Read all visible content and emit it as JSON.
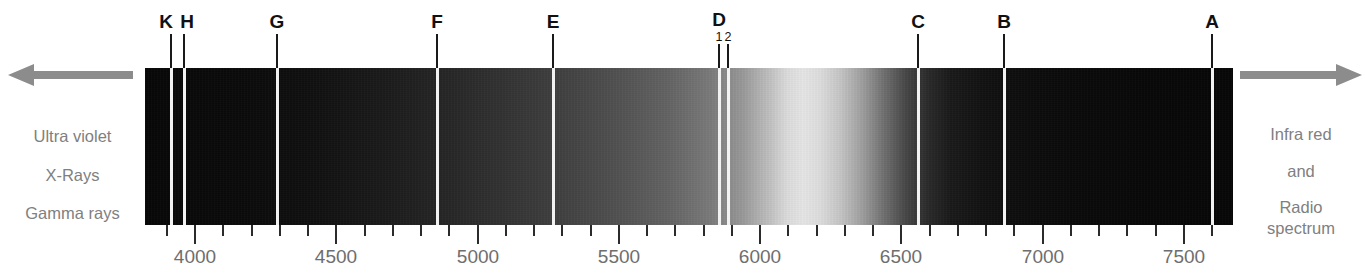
{
  "figure": {
    "band": {
      "x_left_px": 145,
      "x_right_px": 1233,
      "y_top_px": 68,
      "y_bottom_px": 225,
      "wavelength_min": 3830,
      "wavelength_max": 7680,
      "unit": "angstrom"
    },
    "colors": {
      "line": "#f2f2f2",
      "arrow": "#8c8c8c",
      "side_text": "#808080",
      "axis_text": "#6e6e6e",
      "label_text": "#111111",
      "tick": "#2b2b2b",
      "background": "#ffffff"
    }
  },
  "left_annotation": {
    "arrow_icon": "arrow-left-icon",
    "arrow_direction": "left",
    "lines": [
      "Ultra violet",
      "X-Rays",
      "Gamma rays"
    ]
  },
  "right_annotation": {
    "arrow_icon": "arrow-right-icon",
    "arrow_direction": "right",
    "lines": [
      "Infra red",
      "and",
      "Radio",
      "spectrum"
    ]
  },
  "chart_data": {
    "type": "line",
    "xlabel": "",
    "ylabel": "",
    "xlim": [
      3830,
      7680
    ],
    "grid": false,
    "legend": null,
    "axis_ticks_major": [
      4000,
      4500,
      5000,
      5500,
      6000,
      6500,
      7000,
      7500
    ],
    "axis_tick_labels": [
      "4000",
      "4500",
      "5000",
      "5500",
      "6000",
      "6500",
      "7000",
      "7500"
    ],
    "axis_tick_minor_step": 100,
    "annotations": [
      "Ultra violet",
      "X-Rays",
      "Gamma rays",
      "Infra red",
      "and",
      "Radio",
      "spectrum"
    ]
  },
  "fraunhofer_lines": [
    {
      "label": "K",
      "sub": "",
      "wavelength": 3933,
      "x_px": 171,
      "label_x_px": 166,
      "width_px": 3
    },
    {
      "label": "H",
      "sub": "",
      "wavelength": 3968,
      "x_px": 184,
      "label_x_px": 187,
      "width_px": 3
    },
    {
      "label": "G",
      "sub": "",
      "wavelength": 4290,
      "x_px": 277,
      "label_x_px": 277,
      "width_px": 3
    },
    {
      "label": "F",
      "sub": "",
      "wavelength": 4861,
      "x_px": 437,
      "label_x_px": 437,
      "width_px": 3
    },
    {
      "label": "E",
      "sub": "",
      "wavelength": 5270,
      "x_px": 553,
      "label_x_px": 553,
      "width_px": 3
    },
    {
      "label": "D",
      "sub": "1",
      "wavelength": 5896,
      "x_px": 719,
      "label_x_px": 719,
      "width_px": 3
    },
    {
      "label": "",
      "sub": "2",
      "wavelength": 5890,
      "x_px": 728,
      "label_x_px": 728,
      "width_px": 3
    },
    {
      "label": "C",
      "sub": "",
      "wavelength": 6563,
      "x_px": 918,
      "label_x_px": 918,
      "width_px": 3
    },
    {
      "label": "B",
      "sub": "",
      "wavelength": 6870,
      "x_px": 1004,
      "label_x_px": 1004,
      "width_px": 3
    },
    {
      "label": "A",
      "sub": "",
      "wavelength": 7594,
      "x_px": 1212,
      "label_x_px": 1212,
      "width_px": 3
    }
  ],
  "axis": {
    "major_ticks": [
      {
        "value": 4000,
        "x_px": 195
      },
      {
        "value": 4500,
        "x_px": 336
      },
      {
        "value": 5000,
        "x_px": 478
      },
      {
        "value": 5500,
        "x_px": 619
      },
      {
        "value": 6000,
        "x_px": 760
      },
      {
        "value": 6500,
        "x_px": 901
      },
      {
        "value": 7000,
        "x_px": 1043
      },
      {
        "value": 7500,
        "x_px": 1184
      }
    ],
    "minor_step": 100
  }
}
